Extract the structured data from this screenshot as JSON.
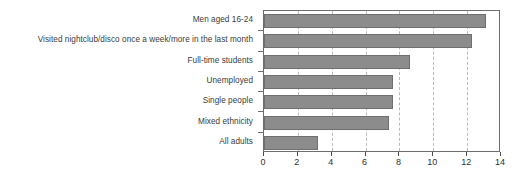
{
  "chart_data": {
    "type": "bar",
    "orientation": "horizontal",
    "title": "",
    "subtitle": "",
    "xlabel": "",
    "ylabel": "",
    "xlim": [
      0,
      14
    ],
    "ylim": null,
    "grid": true,
    "legend": null,
    "legend_position": "none",
    "bar_color": "#8c8c8c",
    "bar_border_color": "#6f6f6f",
    "axis_color": "#6d6d6d",
    "gridline_color": "#b9b9b9",
    "label_color": "#3b3b3b",
    "xticks": [
      0,
      2,
      4,
      6,
      8,
      10,
      12,
      14
    ],
    "xtick_labels": [
      "0",
      "2",
      "4",
      "6",
      "8",
      "10",
      "12",
      "14"
    ],
    "categories": [
      "Men aged 16-24",
      "Visited nightclub/disco once a week/more in the last month",
      "Full-time students",
      "Unemployed",
      "Single people",
      "Mixed ethnicity",
      "All adults"
    ],
    "values": [
      13.1,
      12.3,
      8.6,
      7.6,
      7.6,
      7.4,
      3.2
    ]
  }
}
